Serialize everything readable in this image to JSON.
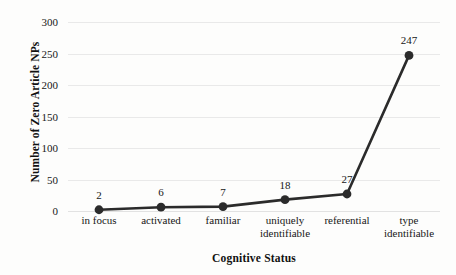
{
  "chart_data": {
    "type": "line",
    "title": "",
    "xlabel": "Cognitive Status",
    "ylabel": "Number of Zero Article NPs",
    "categories": [
      "in focus",
      "activated",
      "familiar",
      "uniquely identifiable",
      "referential",
      "type identifiable"
    ],
    "category_lines": [
      [
        "in focus"
      ],
      [
        "activated"
      ],
      [
        "familiar"
      ],
      [
        "uniquely",
        "identifiable"
      ],
      [
        "referential"
      ],
      [
        "type",
        "identifiable"
      ]
    ],
    "values": [
      2,
      6,
      7,
      18,
      27,
      247
    ],
    "point_labels": [
      "2",
      "6",
      "7",
      "18",
      "27",
      "247"
    ],
    "ylim": [
      0,
      300
    ],
    "yticks": [
      0,
      50,
      100,
      150,
      200,
      250,
      300
    ],
    "ytick_labels": [
      "0",
      "50",
      "100",
      "150",
      "200",
      "250",
      "300"
    ],
    "grid": true,
    "legend": false,
    "series": [
      {
        "name": "Zero Article NPs",
        "values": [
          2,
          6,
          7,
          18,
          27,
          247
        ],
        "line_color": "#2b2b2b",
        "marker_color": "#2b2b2b",
        "marker": "circle"
      }
    ],
    "colors": {
      "line": "#2b2b2b",
      "marker": "#2b2b2b",
      "grid": "#e9e9e9",
      "text": "#171717",
      "background": "#fdfdfc"
    }
  }
}
